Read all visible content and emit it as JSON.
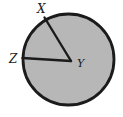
{
  "figure": {
    "labels": {
      "x": "X",
      "y": "Y",
      "z": "Z"
    },
    "colors": {
      "background": "#ffffff",
      "circle_fill": "#b7b7b7",
      "outline": "#1b1b1b"
    },
    "geometry": {
      "circle": {
        "cx": 68.5,
        "cy": 59.5,
        "r": 45.5
      },
      "radius_yx": {
        "x1": 71,
        "y1": 61,
        "x2": 44.5,
        "y2": 17.5
      },
      "radius_yz": {
        "x1": 71,
        "y1": 61,
        "x2": 22.5,
        "y2": 58
      }
    }
  }
}
